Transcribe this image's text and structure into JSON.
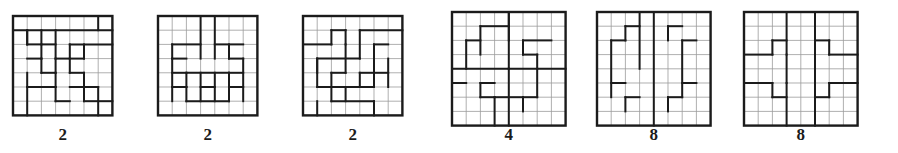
{
  "page": {
    "background_color": "#ffffff",
    "ink_color": "#1b1b1b",
    "grid_line_color": "#9a9a9a",
    "figure_count": 6
  },
  "figures": [
    {
      "id": "figure-1",
      "label": "2",
      "grid_cols": 7,
      "grid_rows": 7,
      "x": 13,
      "y": 16,
      "cell": 14.2,
      "label_y": 126,
      "h_edges": [
        [
          1,
          0,
          7
        ],
        [
          2,
          1,
          3
        ],
        [
          2,
          4,
          7
        ],
        [
          3,
          1,
          2
        ],
        [
          3,
          3,
          5
        ],
        [
          4,
          2,
          3
        ],
        [
          4,
          4,
          5
        ],
        [
          5,
          1,
          3
        ],
        [
          5,
          4,
          6
        ],
        [
          6,
          3,
          4
        ],
        [
          6,
          5,
          7
        ]
      ],
      "v_edges": [
        [
          0,
          1,
          1,
          2
        ],
        [
          1,
          2,
          2,
          3
        ],
        [
          1,
          3,
          4,
          5
        ],
        [
          1,
          6,
          0,
          1
        ],
        [
          2,
          2,
          3,
          4
        ],
        [
          2,
          4,
          2,
          3
        ],
        [
          2,
          5,
          4,
          6
        ],
        [
          3,
          1,
          4,
          5
        ],
        [
          3,
          3,
          5,
          6
        ],
        [
          3,
          6,
          5,
          7
        ],
        [
          4,
          1,
          1,
          2
        ],
        [
          4,
          3,
          3,
          4
        ],
        [
          5,
          2,
          1,
          2
        ],
        [
          5,
          4,
          3,
          4
        ],
        [
          5,
          5,
          2,
          3
        ],
        [
          6,
          1,
          5,
          7
        ],
        [
          6,
          3,
          1,
          3
        ]
      ]
    },
    {
      "id": "figure-2",
      "label": "2",
      "grid_cols": 7,
      "grid_rows": 7,
      "x": 158,
      "y": 16,
      "cell": 14.2,
      "label_y": 126,
      "h_edges": [
        [
          2,
          1,
          3
        ],
        [
          2,
          4,
          6
        ],
        [
          3,
          1,
          2
        ],
        [
          3,
          5,
          6
        ],
        [
          4,
          1,
          2
        ],
        [
          4,
          2,
          5
        ],
        [
          4,
          5,
          6
        ],
        [
          5,
          1,
          2
        ],
        [
          5,
          3,
          4
        ],
        [
          5,
          5,
          6
        ],
        [
          6,
          2,
          5
        ]
      ],
      "v_edges": [
        [
          1,
          3,
          0,
          3
        ],
        [
          1,
          4,
          0,
          3
        ],
        [
          2,
          1,
          2,
          3
        ],
        [
          2,
          5,
          2,
          3
        ],
        [
          3,
          1,
          3,
          6
        ],
        [
          3,
          2,
          4,
          5
        ],
        [
          3,
          5,
          4,
          5
        ],
        [
          3,
          6,
          3,
          6
        ],
        [
          4,
          2,
          5,
          6
        ],
        [
          4,
          5,
          5,
          6
        ],
        [
          5,
          3,
          4,
          6
        ],
        [
          5,
          4,
          4,
          6
        ]
      ]
    },
    {
      "id": "figure-3",
      "label": "2",
      "grid_cols": 7,
      "grid_rows": 7,
      "x": 303,
      "y": 16,
      "cell": 14.2,
      "label_y": 126,
      "h_edges": [
        [
          1,
          2,
          3
        ],
        [
          1,
          4,
          7
        ],
        [
          2,
          0,
          2
        ],
        [
          2,
          5,
          6
        ],
        [
          3,
          1,
          4
        ],
        [
          4,
          2,
          3
        ],
        [
          4,
          4,
          6
        ],
        [
          5,
          1,
          3
        ],
        [
          5,
          3,
          5
        ],
        [
          6,
          2,
          5
        ]
      ],
      "v_edges": [
        [
          1,
          2,
          1,
          2
        ],
        [
          1,
          4,
          1,
          3
        ],
        [
          2,
          1,
          3,
          4
        ],
        [
          2,
          3,
          2,
          4
        ],
        [
          2,
          5,
          2,
          4
        ],
        [
          3,
          2,
          4,
          6
        ],
        [
          3,
          4,
          4,
          5
        ],
        [
          4,
          1,
          3,
          5
        ],
        [
          4,
          3,
          5,
          6
        ],
        [
          4,
          5,
          4,
          5
        ],
        [
          5,
          1,
          6,
          7
        ],
        [
          5,
          6,
          3,
          5
        ],
        [
          6,
          3,
          1,
          2
        ],
        [
          6,
          5,
          6,
          7
        ]
      ]
    },
    {
      "id": "figure-4",
      "label": "4",
      "grid_cols": 8,
      "grid_rows": 8,
      "x": 452,
      "y": 12,
      "cell": 14.2,
      "label_y": 126,
      "h_edges": [
        [
          1,
          2,
          4
        ],
        [
          2,
          1,
          2
        ],
        [
          2,
          5,
          7
        ],
        [
          3,
          5,
          6
        ],
        [
          4,
          0,
          4
        ],
        [
          4,
          4,
          8
        ],
        [
          5,
          0,
          1
        ],
        [
          5,
          2,
          3
        ],
        [
          6,
          2,
          3
        ],
        [
          6,
          5,
          6
        ],
        [
          6,
          3,
          5
        ]
      ],
      "v_edges": [
        [
          1,
          2,
          1,
          3
        ],
        [
          1,
          4,
          0,
          2
        ],
        [
          1,
          5,
          2,
          3
        ],
        [
          2,
          1,
          2,
          4
        ],
        [
          2,
          6,
          3,
          4
        ],
        [
          3,
          4,
          0,
          4
        ],
        [
          3,
          4,
          4,
          8
        ],
        [
          5,
          2,
          5,
          6
        ],
        [
          5,
          5,
          6,
          7
        ],
        [
          6,
          3,
          6,
          8
        ],
        [
          6,
          6,
          4,
          6
        ]
      ]
    },
    {
      "id": "figure-5",
      "label": "8",
      "grid_cols": 8,
      "grid_rows": 8,
      "x": 597,
      "y": 12,
      "cell": 14.2,
      "label_y": 126,
      "h_edges": [
        [
          1,
          2,
          3
        ],
        [
          1,
          5,
          6
        ],
        [
          2,
          1,
          2
        ],
        [
          2,
          6,
          7
        ],
        [
          5,
          1,
          2
        ],
        [
          5,
          6,
          7
        ],
        [
          6,
          2,
          3
        ],
        [
          6,
          5,
          6
        ]
      ],
      "v_edges": [
        [
          1,
          2,
          1,
          2
        ],
        [
          1,
          5,
          1,
          2
        ],
        [
          2,
          1,
          2,
          6
        ],
        [
          2,
          6,
          2,
          6
        ],
        [
          4,
          4,
          0,
          8
        ],
        [
          5,
          2,
          6,
          7
        ],
        [
          5,
          5,
          6,
          7
        ],
        [
          0,
          3,
          4,
          0,
          0
        ]
      ]
    },
    {
      "id": "figure-6",
      "label": "8",
      "grid_cols": 8,
      "grid_rows": 8,
      "x": 744,
      "y": 12,
      "cell": 14.2,
      "label_y": 126,
      "h_edges": [
        [
          2,
          2,
          3
        ],
        [
          2,
          5,
          6
        ],
        [
          3,
          0,
          2
        ],
        [
          3,
          6,
          8
        ],
        [
          5,
          0,
          2
        ],
        [
          5,
          6,
          8
        ],
        [
          6,
          2,
          3
        ],
        [
          6,
          5,
          6
        ]
      ],
      "v_edges": [
        [
          2,
          3,
          0,
          3
        ],
        [
          2,
          5,
          0,
          3
        ],
        [
          2,
          2,
          2,
          3
        ],
        [
          2,
          6,
          2,
          3
        ],
        [
          4,
          3,
          3,
          5
        ],
        [
          4,
          5,
          3,
          5
        ],
        [
          5,
          2,
          5,
          6
        ],
        [
          5,
          6,
          5,
          6
        ],
        [
          5,
          3,
          5,
          8
        ],
        [
          5,
          5,
          5,
          8
        ]
      ]
    }
  ]
}
